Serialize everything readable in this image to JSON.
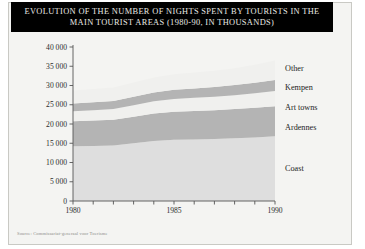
{
  "figure": {
    "title_lines": [
      "EVOLUTION OF THE NUMBER OF NIGHTS SPENT BY TOURISTS IN THE",
      "MAIN TOURIST AREAS (1980-90, IN THOUSANDS)"
    ],
    "source": "Source: Commissariat-generaal voor Toerisme",
    "background_color": "#f4f4f2",
    "title_background_color": "#000000",
    "title_text_color": "#e9e9e4"
  },
  "chart_data": {
    "type": "area",
    "title": "EVOLUTION OF THE NUMBER OF NIGHTS SPENT BY TOURISTS IN THE MAIN TOURIST AREAS (1980-90, IN THOUSANDS)",
    "xlabel": "",
    "ylabel": "",
    "stacked": true,
    "grid": false,
    "legend_position": "right",
    "xlim": [
      1980,
      1990
    ],
    "ylim": [
      0,
      40000
    ],
    "x": [
      1980,
      1981,
      1982,
      1983,
      1984,
      1985,
      1986,
      1987,
      1988,
      1989,
      1990
    ],
    "xticks": [
      1980,
      1981,
      1982,
      1983,
      1984,
      1985,
      1986,
      1987,
      1988,
      1989,
      1990
    ],
    "xtick_labels": [
      "1980",
      "",
      "",
      "",
      "",
      "1985",
      "",
      "",
      "",
      "",
      "1990"
    ],
    "yticks": [
      0,
      5000,
      10000,
      15000,
      20000,
      25000,
      30000,
      35000,
      40000
    ],
    "ytick_labels": [
      "0",
      "5 000",
      "10 000",
      "15 000",
      "20 000",
      "25 000",
      "30 000",
      "35 000",
      "40 000"
    ],
    "series": [
      {
        "name": "Coast",
        "color": "#dedede",
        "values": [
          14200,
          14300,
          14400,
          15000,
          15600,
          15900,
          16000,
          16100,
          16300,
          16500,
          16800
        ]
      },
      {
        "name": "Ardennes",
        "color": "#b4b4b4",
        "values": [
          6500,
          6600,
          6700,
          6900,
          7100,
          7300,
          7400,
          7500,
          7600,
          7700,
          7800
        ]
      },
      {
        "name": "Art towns",
        "color": "#f0f0ee",
        "values": [
          2600,
          2700,
          2800,
          3000,
          3200,
          3300,
          3400,
          3500,
          3600,
          3800,
          4000
        ]
      },
      {
        "name": "Kempen",
        "color": "#b4b4b4",
        "values": [
          2000,
          2050,
          2100,
          2200,
          2300,
          2400,
          2450,
          2500,
          2600,
          2700,
          2800
        ]
      },
      {
        "name": "Other",
        "color": "#f0f0ee",
        "values": [
          3400,
          3450,
          3500,
          3700,
          3900,
          4000,
          4100,
          4200,
          4400,
          4700,
          5100
        ]
      }
    ],
    "legend_entries": [
      {
        "label": "Other",
        "y_value": 34500
      },
      {
        "label": "Kempen",
        "y_value": 29500
      },
      {
        "label": "Art towns",
        "y_value": 24300
      },
      {
        "label": "Ardennes",
        "y_value": 19200
      },
      {
        "label": "Coast",
        "y_value": 8500
      }
    ]
  }
}
